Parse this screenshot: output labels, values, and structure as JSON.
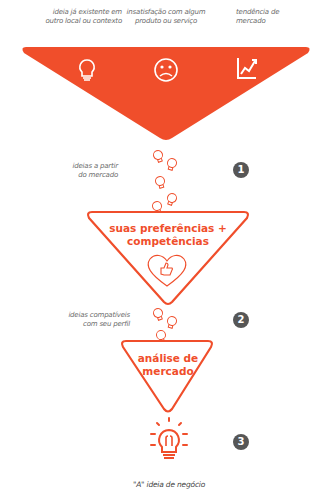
{
  "colors": {
    "accent": "#F04E2B",
    "badge": "#565656",
    "label": "#6b6b6b"
  },
  "top_sources": [
    {
      "label_line1": "ideia já existente em",
      "label_line2": "outro local ou contexto",
      "icon": "lightbulb-icon"
    },
    {
      "label_line1": "insatisfação com algum",
      "label_line2": "produto ou serviço",
      "icon": "sad-face-icon"
    },
    {
      "label_line1": "tendência de",
      "label_line2": "mercado",
      "icon": "trend-chart-icon"
    }
  ],
  "stages": [
    {
      "number": "1",
      "side_label_line1": "ideias a partir",
      "side_label_line2": "do mercado"
    },
    {
      "number": "2",
      "title_line1": "suas preferências +",
      "title_line2": "competências",
      "icon": "heart-thumbs-up-icon",
      "side_label_line1": "ideias compatíveis",
      "side_label_line2": "com seu perfil"
    },
    {
      "number": "3",
      "title_line1": "análise de",
      "title_line2": "mercado"
    }
  ],
  "result": {
    "label": "\"A\" ideia de negócio",
    "icon": "lightbulb-idea-icon"
  }
}
